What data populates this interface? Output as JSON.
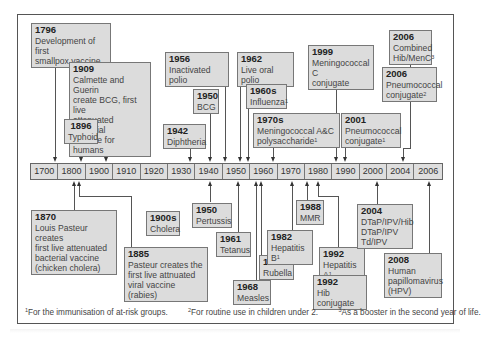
{
  "timeline": {
    "axis_labels": [
      "1700",
      "1800",
      "1900",
      "1910",
      "1920",
      "1930",
      "1940",
      "1950",
      "1960",
      "1970",
      "1980",
      "1990",
      "2000",
      "2004",
      "2006",
      "2008"
    ],
    "events_above": [
      {
        "year": "1796",
        "text": "Development of first\nsmallpox vaccine"
      },
      {
        "year": "1909",
        "text": "Calmette and Guerin\ncreate BCG, first live\nattenuated bacterial\nvaccine for humans"
      },
      {
        "year": "1896",
        "text": "Typhoid"
      },
      {
        "year": "1942",
        "text": "Diphtheria"
      },
      {
        "year": "1956",
        "text": "Inactivated polio"
      },
      {
        "year": "1950",
        "text": "BCG"
      },
      {
        "year": "1962",
        "text": "Live oral polio"
      },
      {
        "year": "1960s",
        "text": "Influenza",
        "sup": "1"
      },
      {
        "year": "1970s",
        "text": "Meningococcal A&C\npolysaccharide",
        "sup": "1"
      },
      {
        "year": "1999",
        "text": "Meningococcal C\nconjugate"
      },
      {
        "year": "2001",
        "text": "Pneumococcal\nconjugate",
        "sup": "1"
      },
      {
        "year": "2006",
        "text": "Combined\nHib/MenC",
        "sup": "3"
      },
      {
        "year": "2006",
        "text": "Pneumococcal\nconjugate",
        "sup": "2"
      }
    ],
    "events_below": [
      {
        "year": "1870",
        "text": "Louis Pasteur creates\nfirst live attenuated\nbacterial vaccine\n(chicken cholera)"
      },
      {
        "year": "1885",
        "text": "Pasteur creates the\nfirst live attnuated\nviral vaccine (rabies)"
      },
      {
        "year": "1900s",
        "text": "Cholera"
      },
      {
        "year": "1950",
        "text": "Pertussis"
      },
      {
        "year": "1961",
        "text": "Tetanus"
      },
      {
        "year": "1968",
        "text": "Measles"
      },
      {
        "year": "1970",
        "text": "Rubella"
      },
      {
        "year": "1982",
        "text": "Hepatitis B",
        "sup": "1"
      },
      {
        "year": "1988",
        "text": "MMR"
      },
      {
        "year": "1992",
        "text": "Hepatitis A",
        "sup": "1"
      },
      {
        "year": "1992",
        "text": "Hib conjugate"
      },
      {
        "year": "2004",
        "text": "DTaP/IPV/Hib\nDTaP/IPV\nTd/IPV"
      },
      {
        "year": "2008",
        "text": "Human\npapillomavirus\n(HPV)"
      }
    ]
  },
  "footnotes": [
    {
      "mark": "1",
      "text": "For the immunisation of at-risk groups."
    },
    {
      "mark": "2",
      "text": "For routine use in children under 2."
    },
    {
      "mark": "3",
      "text": "As a booster in the second year of life."
    }
  ],
  "colors": {
    "box_fill": "#dcdcdc",
    "border": "#777777",
    "text": "#333333"
  }
}
